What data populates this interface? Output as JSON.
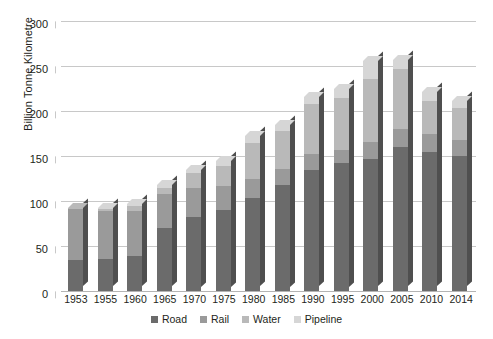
{
  "chart_data": {
    "type": "bar",
    "subtype": "stacked-bar-3d",
    "title": "",
    "xlabel": "",
    "ylabel": "Billion Tonne Kilometre",
    "ylim": [
      0,
      300
    ],
    "yticks": [
      0,
      50,
      100,
      150,
      200,
      250,
      300
    ],
    "grid": true,
    "legend_position": "bottom",
    "categories": [
      "1953",
      "1955",
      "1960",
      "1965",
      "1970",
      "1975",
      "1980",
      "1985",
      "1990",
      "1995",
      "2000",
      "2005",
      "2010",
      "2014"
    ],
    "series": [
      {
        "name": "Road",
        "color": "#6b6b6b",
        "values": [
          35,
          36,
          39,
          70,
          82,
          90,
          103,
          118,
          135,
          142,
          147,
          160,
          155,
          150
        ]
      },
      {
        "name": "Rail",
        "color": "#9a9a9a",
        "values": [
          56,
          53,
          50,
          38,
          33,
          27,
          22,
          18,
          17,
          15,
          19,
          20,
          19,
          18
        ]
      },
      {
        "name": "Water",
        "color": "#b9b9b9",
        "values": [
          1,
          2,
          5,
          7,
          16,
          22,
          39,
          42,
          56,
          57,
          70,
          67,
          37,
          35
        ]
      },
      {
        "name": "Pipeline",
        "color": "#d6d6d6",
        "values": [
          0,
          1,
          3,
          3,
          4,
          6,
          8,
          7,
          8,
          11,
          20,
          10,
          10,
          8
        ]
      }
    ],
    "totals": [
      92,
      92,
      97,
      118,
      135,
      145,
      172,
      185,
      216,
      225,
      256,
      257,
      221,
      211
    ]
  },
  "legend": {
    "items": [
      {
        "label": "Road",
        "color": "#6b6b6b"
      },
      {
        "label": "Rail",
        "color": "#9a9a9a"
      },
      {
        "label": "Water",
        "color": "#b9b9b9"
      },
      {
        "label": "Pipeline",
        "color": "#d6d6d6"
      }
    ]
  },
  "colors": {
    "grid": "#c8c8c8",
    "text": "#231f20",
    "background": "#ffffff"
  }
}
